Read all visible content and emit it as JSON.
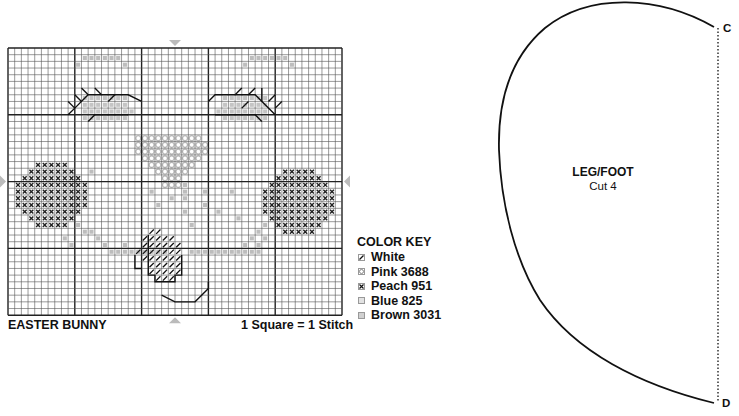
{
  "chart": {
    "title": "EASTER BUNNY",
    "scale_note": "1 Square = 1 Stitch",
    "grid": {
      "cols": 50,
      "rows": 40,
      "origin_x": 8,
      "origin_y": 48,
      "cell": 6.68,
      "bold_every": 10
    },
    "colors": {
      "grid_line": "#555555",
      "bold_line": "#222222",
      "pink": "#b8b8b8",
      "blue": "#c4c4c4",
      "brown": "#bdbdbd",
      "peach": "#222222",
      "white": "#111111",
      "center_arrow": "#bbbbbb"
    }
  },
  "color_key": {
    "title": "COLOR KEY",
    "items": [
      {
        "symbol": "slash",
        "label": "White"
      },
      {
        "symbol": "circle",
        "label": "Pink 3688"
      },
      {
        "symbol": "cross",
        "label": "Peach 951"
      },
      {
        "symbol": "dot-light",
        "label": "Blue 825"
      },
      {
        "symbol": "dot",
        "label": "Brown 3031"
      }
    ]
  },
  "pattern_piece": {
    "name": "LEG/FOOT",
    "instruction": "Cut 4",
    "point_top": "C",
    "point_bottom": "D"
  }
}
